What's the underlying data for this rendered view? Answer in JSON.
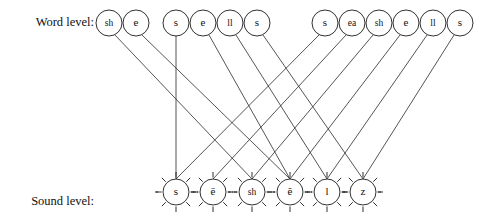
{
  "figure": {
    "title": "",
    "background_color": "#ffffff",
    "line_color": "#2a2a2a",
    "node_stroke_color": "#1a1a1a",
    "node_fill_color": "#ffffff",
    "text_color": "#111111"
  },
  "labels": {
    "word_level": "Word level:",
    "sound_level_line1": "Sound level:",
    "sound_level_line2": "(last word)"
  },
  "word_level": {
    "groups": [
      {
        "word": "she",
        "units": [
          {
            "text": "sh",
            "cx": 109,
            "cy": 23,
            "r": 13
          },
          {
            "text": "e",
            "cx": 136,
            "cy": 23,
            "r": 13
          }
        ]
      },
      {
        "word": "sells",
        "units": [
          {
            "text": "s",
            "cx": 176,
            "cy": 23,
            "r": 13
          },
          {
            "text": "e",
            "cx": 203,
            "cy": 23,
            "r": 13
          },
          {
            "text": "ll",
            "cx": 230,
            "cy": 23,
            "r": 13
          },
          {
            "text": "s",
            "cx": 257,
            "cy": 23,
            "r": 13
          }
        ]
      },
      {
        "word": "seashells",
        "units": [
          {
            "text": "s",
            "cx": 325,
            "cy": 23,
            "r": 13
          },
          {
            "text": "ea",
            "cx": 352,
            "cy": 23,
            "r": 13
          },
          {
            "text": "sh",
            "cx": 379,
            "cy": 23,
            "r": 13
          },
          {
            "text": "e",
            "cx": 406,
            "cy": 23,
            "r": 13
          },
          {
            "text": "ll",
            "cx": 433,
            "cy": 23,
            "r": 13
          },
          {
            "text": "s",
            "cx": 460,
            "cy": 23,
            "r": 13
          }
        ]
      }
    ]
  },
  "sound_level": {
    "units": [
      {
        "text": "s",
        "cx": 176,
        "cy": 192,
        "r": 13
      },
      {
        "text": "ē",
        "cx": 213,
        "cy": 192,
        "r": 13
      },
      {
        "text": "sh",
        "cx": 252,
        "cy": 192,
        "r": 13
      },
      {
        "text": "ĕ",
        "cx": 290,
        "cy": 192,
        "r": 13
      },
      {
        "text": "l",
        "cx": 327,
        "cy": 192,
        "r": 13
      },
      {
        "text": "z",
        "cx": 363,
        "cy": 192,
        "r": 13
      }
    ]
  },
  "connections": [
    {
      "from_word": "sh",
      "from_x": 115,
      "from_y": 35,
      "to_sound": "sh",
      "to_x": 252,
      "to_y": 179
    },
    {
      "from_word": "e",
      "from_x": 142,
      "from_y": 35,
      "to_sound": "ĕ",
      "to_x": 290,
      "to_y": 179
    },
    {
      "from_word": "s",
      "from_x": 176,
      "from_y": 36,
      "to_sound": "s",
      "to_x": 176,
      "to_y": 179
    },
    {
      "from_word": "e",
      "from_x": 209,
      "from_y": 35,
      "to_sound": "ĕ",
      "to_x": 290,
      "to_y": 179
    },
    {
      "from_word": "ll",
      "from_x": 236,
      "from_y": 35,
      "to_sound": "l",
      "to_x": 327,
      "to_y": 179
    },
    {
      "from_word": "s",
      "from_x": 263,
      "from_y": 35,
      "to_sound": "z",
      "to_x": 363,
      "to_y": 179
    },
    {
      "from_word": "s",
      "from_x": 319,
      "from_y": 35,
      "to_sound": "s",
      "to_x": 176,
      "to_y": 179
    },
    {
      "from_word": "ea",
      "from_x": 346,
      "from_y": 35,
      "to_sound": "ē",
      "to_x": 213,
      "to_y": 179
    },
    {
      "from_word": "sh",
      "from_x": 373,
      "from_y": 35,
      "to_sound": "sh",
      "to_x": 252,
      "to_y": 179
    },
    {
      "from_word": "e",
      "from_x": 400,
      "from_y": 35,
      "to_sound": "ĕ",
      "to_x": 290,
      "to_y": 179
    },
    {
      "from_word": "ll",
      "from_x": 427,
      "from_y": 35,
      "to_sound": "l",
      "to_x": 327,
      "to_y": 179
    },
    {
      "from_word": "s",
      "from_x": 454,
      "from_y": 35,
      "to_sound": "z",
      "to_x": 363,
      "to_y": 179
    }
  ]
}
